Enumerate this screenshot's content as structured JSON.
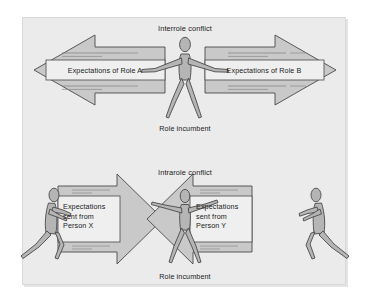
{
  "figure": {
    "type": "role-conflict-diagram",
    "background_color": "#ebebeb",
    "page_color": "#ffffff",
    "arrow_fill": "#c9c9c9",
    "figure_fill": "#b5b5b5",
    "box_fill": "#efefef",
    "outline_color": "#4a4a4a",
    "text_color": "#1a1a1a"
  },
  "panels": {
    "top": {
      "title": "Interrole conflict",
      "caption": "Role incumbent",
      "left_arrow_label": "Expectations of Role A",
      "right_arrow_label": "Expectations of Role B",
      "arrow_direction": "outward",
      "center_figure": "role-incumbent-arms-outstretched"
    },
    "bottom": {
      "title": "Intrarole conflict",
      "caption": "Role incumbent",
      "left_arrow_label_lines": [
        "Expectations",
        "sent from",
        "Person X"
      ],
      "right_arrow_label_lines": [
        "Expectations",
        "sent from",
        "Person Y"
      ],
      "arrow_direction": "inward",
      "center_figure": "role-incumbent-arms-outstretched",
      "left_figure": "person-x-pushing-right",
      "right_figure": "person-y-pushing-left"
    }
  }
}
